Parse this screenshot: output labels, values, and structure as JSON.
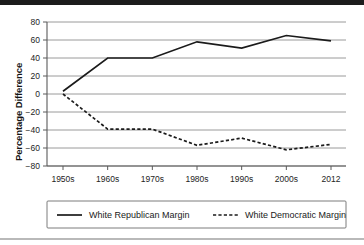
{
  "chart_data": {
    "type": "line",
    "title": "",
    "xlabel": "",
    "ylabel": "Percentage Difference",
    "categories": [
      "1950s",
      "1960s",
      "1970s",
      "1980s",
      "1990s",
      "2000s",
      "2012"
    ],
    "yticks": [
      80,
      60,
      40,
      20,
      0,
      -20,
      -40,
      -60,
      -80
    ],
    "ytick_labels": [
      "80",
      "60",
      "40",
      "20",
      "0",
      "−20",
      "−40",
      "−60",
      "−80"
    ],
    "ylim": [
      -80,
      80
    ],
    "grid": true,
    "legend_position": "bottom",
    "series": [
      {
        "name": "White Republican Margin",
        "style": "solid",
        "color": "#1b1b1b",
        "values": [
          3,
          40,
          40,
          58,
          51,
          65,
          59
        ]
      },
      {
        "name": "White Democratic Margin",
        "style": "dashed",
        "color": "#1b1b1b",
        "values": [
          0,
          -39,
          -39,
          -57,
          -49,
          -62,
          -56
        ]
      }
    ]
  },
  "axes": {
    "y_axis_title": "Percentage Difference"
  },
  "legend": {
    "entries": [
      {
        "label": "White Republican Margin",
        "style": "solid"
      },
      {
        "label": "White Democratic Margin",
        "style": "dashed"
      }
    ]
  }
}
